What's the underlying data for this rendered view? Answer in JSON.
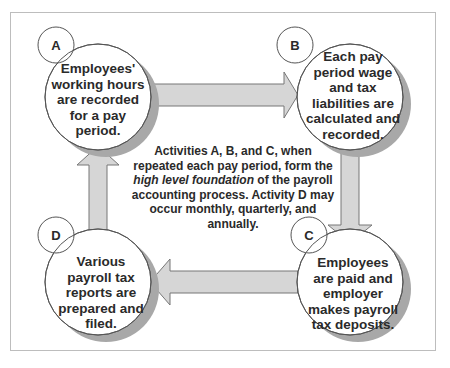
{
  "diagram": {
    "type": "cycle",
    "colors": {
      "frame_border": "#bdbdbd",
      "circle_fill": "#ffffff",
      "circle_stroke": "#555555",
      "shadow": "#a8a8a8",
      "arrow_fill": "#d6d6d6",
      "arrow_stroke": "#777777",
      "text": "#2a2a2a"
    },
    "nodes": [
      {
        "id": "A",
        "label": "A",
        "text_lines": [
          "Employees'",
          "working hours",
          "are recorded",
          "for a pay",
          "period."
        ]
      },
      {
        "id": "B",
        "label": "B",
        "text_lines": [
          "Each pay",
          "period wage",
          "and tax",
          "liabilities are",
          "calculated and",
          "recorded."
        ]
      },
      {
        "id": "C",
        "label": "C",
        "text_lines": [
          "Employees",
          "are paid and",
          "employer",
          "makes payroll",
          "tax deposits."
        ]
      },
      {
        "id": "D",
        "label": "D",
        "text_lines": [
          "Various",
          "payroll tax",
          "reports are",
          "prepared and",
          "filed."
        ]
      }
    ],
    "edges": [
      {
        "from": "A",
        "to": "B",
        "direction": "right"
      },
      {
        "from": "B",
        "to": "C",
        "direction": "down"
      },
      {
        "from": "C",
        "to": "D",
        "direction": "left"
      },
      {
        "from": "D",
        "to": "A",
        "direction": "up"
      }
    ],
    "center_note": {
      "part1": "Activities A, B, and C, when repeated each pay period, form the ",
      "emphasis": "high level foundation",
      "part2": " of the payroll accounting process. Activity D may occur monthly, quarterly, and annually."
    }
  }
}
